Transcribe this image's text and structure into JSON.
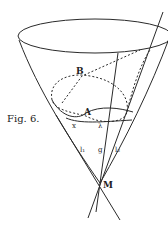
{
  "figure": {
    "caption": "Fig. 6.",
    "points": {
      "A": "A",
      "B": "B",
      "M": "M"
    },
    "line_labels": {
      "x": "x",
      "lambda": "λ",
      "l1": "l₁",
      "g": "g",
      "l2": "l₂"
    },
    "colors": {
      "ink": "#2a2a2a",
      "paper": "#ffffff"
    }
  }
}
